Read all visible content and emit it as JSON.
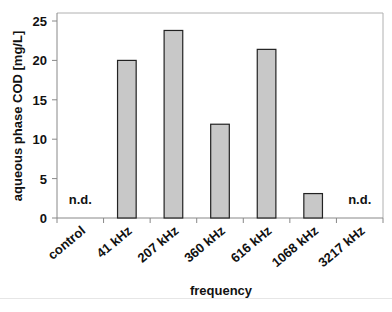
{
  "chart_data": {
    "type": "bar",
    "title": "",
    "xlabel": "frequency",
    "ylabel": "aqueous phase COD [mg/L]",
    "categories": [
      "control",
      "41 kHz",
      "207 kHz",
      "360 kHz",
      "616 kHz",
      "1068 kHz",
      "3217 kHz"
    ],
    "values": [
      null,
      20.0,
      23.8,
      11.9,
      21.4,
      3.1,
      null
    ],
    "annotations": [
      {
        "category": "control",
        "text": "n.d."
      },
      {
        "category": "3217 kHz",
        "text": "n.d."
      }
    ],
    "ylim": [
      0,
      25
    ],
    "yticks": [
      0,
      5,
      10,
      15,
      20,
      25
    ],
    "grid": false,
    "legend": null,
    "bar_color": "#c8c8c8",
    "bar_edge_color": "#222222"
  }
}
